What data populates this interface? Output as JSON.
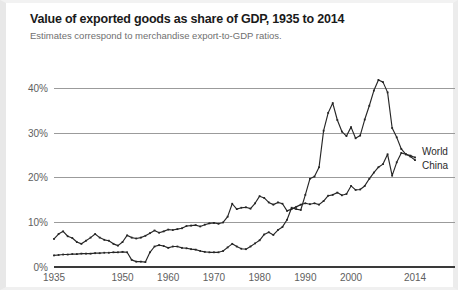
{
  "chart_data": {
    "type": "line",
    "title": "Value of exported goods as share of GDP, 1935 to 2014",
    "subtitle": "Estimates  correspond to merchandise export-to-GDP ratios.",
    "xlabel": "",
    "ylabel": "",
    "xlim": [
      1935,
      2014
    ],
    "ylim": [
      0,
      44
    ],
    "grid": true,
    "legend_position": "right-inline",
    "y_ticks": [
      0,
      10,
      20,
      30,
      40
    ],
    "y_tick_labels": [
      "0%",
      "10%",
      "20%",
      "30%",
      "40%"
    ],
    "x_ticks": [
      1935,
      1950,
      1960,
      1970,
      1980,
      1990,
      2000,
      2014
    ],
    "x_tick_labels": [
      "1935",
      "1950",
      "1960",
      "1970",
      "1980",
      "1990",
      "2000",
      "2014"
    ],
    "x": [
      1935,
      1936,
      1937,
      1938,
      1939,
      1940,
      1941,
      1942,
      1943,
      1944,
      1945,
      1946,
      1947,
      1948,
      1949,
      1950,
      1951,
      1952,
      1953,
      1954,
      1955,
      1956,
      1957,
      1958,
      1959,
      1960,
      1961,
      1962,
      1963,
      1964,
      1965,
      1966,
      1967,
      1968,
      1969,
      1970,
      1971,
      1972,
      1973,
      1974,
      1975,
      1976,
      1977,
      1978,
      1979,
      1980,
      1981,
      1982,
      1983,
      1984,
      1985,
      1986,
      1987,
      1988,
      1989,
      1990,
      1991,
      1992,
      1993,
      1994,
      1995,
      1996,
      1997,
      1998,
      1999,
      2000,
      2001,
      2002,
      2003,
      2004,
      2005,
      2006,
      2007,
      2008,
      2009,
      2010,
      2011,
      2012,
      2013,
      2014
    ],
    "series": [
      {
        "name": "World",
        "color": "#262626",
        "label_x": 2014,
        "label_y": 26.0,
        "values": [
          6.3,
          7.4,
          8.0,
          6.9,
          6.5,
          5.6,
          5.2,
          5.9,
          6.6,
          7.4,
          6.6,
          6.1,
          5.9,
          5.2,
          4.8,
          5.6,
          7.1,
          6.6,
          6.4,
          6.6,
          7.0,
          7.6,
          8.2,
          7.7,
          8.0,
          8.4,
          8.3,
          8.5,
          8.7,
          9.2,
          9.3,
          9.4,
          9.1,
          9.5,
          9.8,
          9.9,
          9.7,
          10.0,
          11.3,
          14.2,
          13.0,
          13.3,
          13.4,
          13.1,
          14.3,
          15.9,
          15.5,
          14.5,
          14.0,
          14.5,
          14.2,
          12.6,
          13.0,
          13.5,
          14.0,
          14.3,
          14.1,
          14.3,
          14.0,
          14.8,
          16.0,
          16.2,
          16.7,
          16.1,
          16.4,
          18.2,
          17.3,
          17.4,
          18.2,
          19.8,
          21.2,
          22.4,
          23.1,
          25.3,
          20.5,
          23.5,
          25.6,
          25.3,
          25.0,
          24.6
        ]
      },
      {
        "name": "China",
        "color": "#262626",
        "label_x": 2014,
        "label_y": 22.8,
        "values": [
          2.6,
          2.7,
          2.8,
          2.8,
          2.9,
          2.9,
          3.0,
          3.0,
          3.0,
          3.1,
          3.1,
          3.2,
          3.2,
          3.3,
          3.3,
          3.4,
          3.3,
          1.6,
          1.2,
          1.2,
          1.1,
          3.3,
          4.6,
          4.9,
          4.7,
          4.3,
          4.6,
          4.6,
          4.3,
          4.2,
          4.0,
          3.9,
          3.6,
          3.4,
          3.3,
          3.3,
          3.3,
          3.6,
          4.4,
          5.2,
          4.6,
          4.1,
          4.0,
          4.6,
          5.3,
          6.0,
          7.3,
          7.8,
          7.2,
          8.3,
          9.0,
          10.6,
          13.3,
          13.0,
          12.8,
          16.2,
          19.8,
          20.3,
          22.4,
          30.6,
          34.6,
          36.8,
          33.0,
          30.4,
          29.4,
          31.4,
          28.9,
          29.5,
          33.1,
          36.2,
          39.6,
          42.0,
          41.5,
          39.2,
          31.2,
          29.1,
          26.5,
          25.3,
          24.8,
          24.0
        ]
      }
    ]
  },
  "plot_geometry": {
    "left": 48,
    "right": 409,
    "top": 68,
    "bottom": 264
  }
}
